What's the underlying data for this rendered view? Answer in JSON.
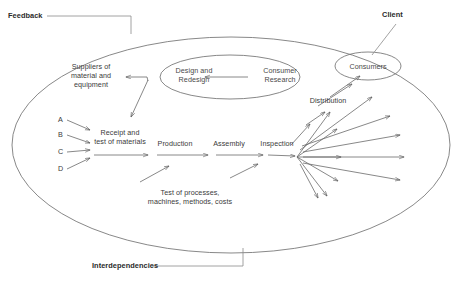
{
  "diagram": {
    "type": "flow-diagram",
    "stroke_color": "#555555",
    "text_color": "#3a3a3a",
    "background": "#ffffff",
    "annotations": {
      "feedback": "Feedback",
      "client": "Client",
      "interdependencies": "Interdependencies"
    },
    "nodes": {
      "suppliers": "Suppliers of\nmaterial and\nequipment",
      "design": "Design and\nRedesign",
      "consumer_research": "Consumer\nResearch",
      "consumers": "Consumers",
      "receipt": "Receipt and\ntest of materials",
      "production": "Production",
      "assembly": "Assembly",
      "inspection": "Inspection",
      "distribution": "Distribution",
      "test_of_processes": "Test of processes,\nmachines, methods, costs"
    },
    "inputs": [
      {
        "label": "A"
      },
      {
        "label": "B"
      },
      {
        "label": "C"
      },
      {
        "label": "D"
      }
    ]
  }
}
